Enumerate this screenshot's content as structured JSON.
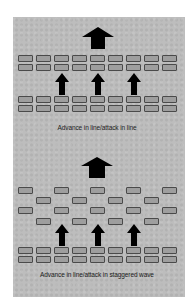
{
  "diagrams": [
    {
      "caption": "Advance in line/attack in line",
      "formation": "line"
    },
    {
      "caption": "Advance in line/attack in staggered wave",
      "formation": "staggered wave"
    }
  ],
  "colors": {
    "panel": "#bdbdbd",
    "brick_fill": "#9e9e9e",
    "brick_border": "#4a4a4a",
    "arrow": "#000000"
  }
}
